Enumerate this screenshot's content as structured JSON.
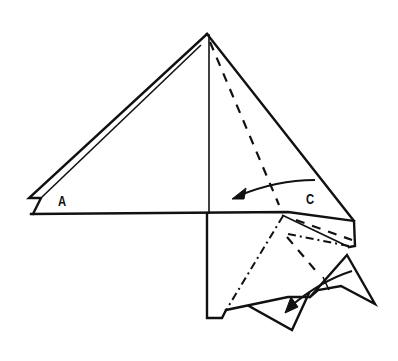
{
  "diagram": {
    "type": "origami-fold-diagram",
    "labels": {
      "a": "A",
      "c": "C"
    },
    "stroke_color": "#111111",
    "background": "#ffffff",
    "fold_types": [
      "valley-fold (dashed)",
      "mountain-fold (dash-dot)"
    ],
    "arrows": [
      "fold-arrow-toward-center",
      "fold-arrow-down-lower-flap"
    ]
  }
}
